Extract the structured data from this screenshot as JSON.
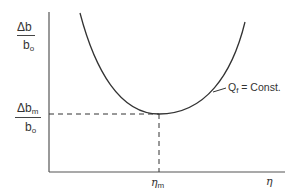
{
  "diagram": {
    "y_axis_label": {
      "numerator_delta": "Δ",
      "numerator_var": "b",
      "denominator_var": "b",
      "denominator_sub": "o"
    },
    "y_min_label": {
      "numerator_delta": "Δ",
      "numerator_var": "b",
      "numerator_sub": "m",
      "denominator_var": "b",
      "denominator_sub": "o"
    },
    "x_axis_label": "η",
    "x_min_label": {
      "var": "η",
      "sub": "m"
    },
    "curve_label": {
      "var": "Q",
      "sub": "f",
      "rest": " = Const."
    },
    "colors": {
      "line": "#333333",
      "background": "#ffffff"
    }
  }
}
